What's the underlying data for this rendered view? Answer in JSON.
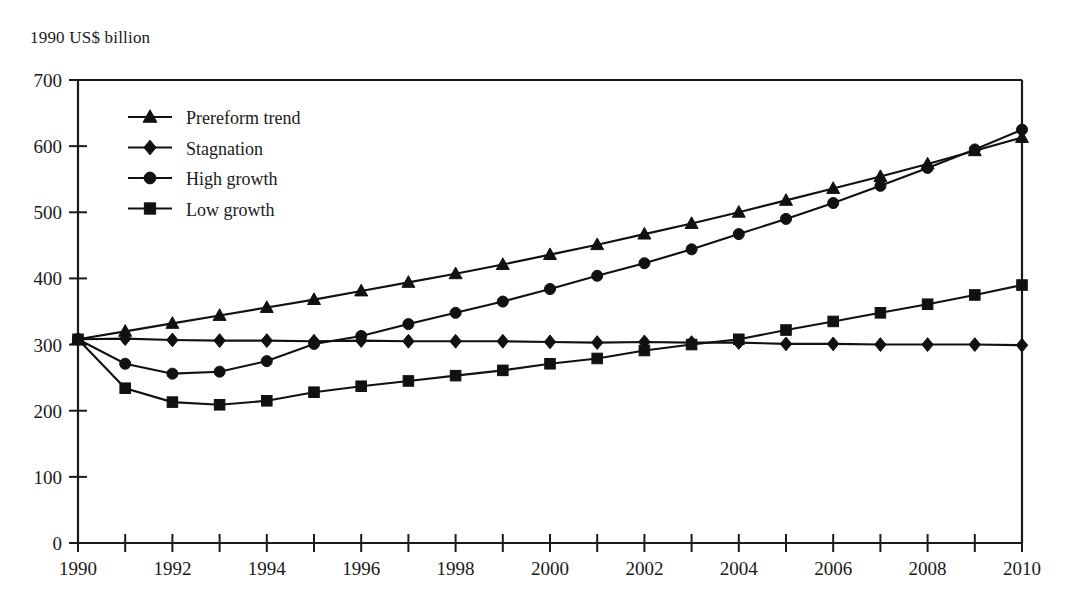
{
  "figure": {
    "unit_label": "1990 US$ billion"
  },
  "chart_data": {
    "type": "line",
    "title": "",
    "subtitle": "",
    "xlabel": "",
    "ylabel": "1990 US$ billion",
    "xlim": [
      1990,
      2010
    ],
    "ylim": [
      0,
      700
    ],
    "x_tick_step_major": 2,
    "x_tick_step_minor": 1,
    "y_tick_step": 100,
    "grid": false,
    "legend_position": "inside-top-left",
    "x": [
      1990,
      1991,
      1992,
      1993,
      1994,
      1995,
      1996,
      1997,
      1998,
      1999,
      2000,
      2001,
      2002,
      2003,
      2004,
      2005,
      2006,
      2007,
      2008,
      2009,
      2010
    ],
    "x_tick_labels": [
      "1990",
      "1992",
      "1994",
      "1996",
      "1998",
      "2000",
      "2002",
      "2004",
      "2006",
      "2008",
      "2010"
    ],
    "y_tick_labels": [
      "0",
      "100",
      "200",
      "300",
      "400",
      "500",
      "600",
      "700"
    ],
    "series": [
      {
        "name": "Prereform trend",
        "marker": "triangle",
        "values": [
          308,
          320,
          332,
          344,
          356,
          368,
          381,
          394,
          407,
          421,
          436,
          451,
          467,
          483,
          500,
          518,
          536,
          554,
          573,
          593,
          613
        ]
      },
      {
        "name": "Stagnation",
        "marker": "diamond",
        "values": [
          308,
          309,
          307,
          306,
          306,
          305,
          306,
          305,
          305,
          305,
          304,
          303,
          304,
          303,
          303,
          301,
          301,
          300,
          300,
          300,
          299
        ]
      },
      {
        "name": "High growth",
        "marker": "circle",
        "values": [
          308,
          271,
          256,
          259,
          275,
          301,
          313,
          331,
          348,
          365,
          384,
          404,
          423,
          444,
          467,
          490,
          514,
          540,
          567,
          595,
          625
        ]
      },
      {
        "name": "Low growth",
        "marker": "square",
        "values": [
          308,
          234,
          213,
          209,
          215,
          228,
          237,
          245,
          253,
          261,
          271,
          279,
          291,
          300,
          308,
          322,
          335,
          348,
          361,
          375,
          390
        ]
      }
    ]
  },
  "legend": {
    "items": [
      {
        "label": "Prereform trend",
        "marker": "triangle"
      },
      {
        "label": "Stagnation",
        "marker": "diamond"
      },
      {
        "label": "High growth",
        "marker": "circle"
      },
      {
        "label": "Low growth",
        "marker": "square"
      }
    ]
  }
}
